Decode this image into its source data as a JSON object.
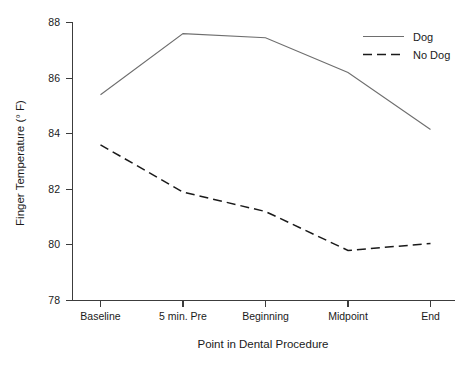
{
  "chart_data": {
    "type": "line",
    "title": "",
    "xlabel": "Point in Dental Procedure",
    "ylabel": "Finger Temperature (° F)",
    "categories": [
      "Baseline",
      "5 min. Pre",
      "Beginning",
      "Midpoint",
      "End"
    ],
    "ylim": [
      78,
      88
    ],
    "yticks": [
      78,
      80,
      82,
      84,
      86,
      88
    ],
    "ytick_labels": [
      "78",
      "80",
      "82",
      "84",
      "86",
      "88"
    ],
    "grid": false,
    "legend_position": "top-right",
    "series": [
      {
        "name": "Dog",
        "style": "solid",
        "color": "#6e6e6e",
        "values": [
          85.4,
          87.6,
          87.45,
          86.2,
          84.15
        ]
      },
      {
        "name": "No Dog",
        "style": "dashed",
        "color": "#1a1a1a",
        "values": [
          83.6,
          81.9,
          81.2,
          79.8,
          80.05
        ]
      }
    ]
  },
  "axes": {
    "y_label": "Finger Temperature (° F)",
    "x_label": "Point in Dental Procedure"
  },
  "legend": {
    "entries": [
      {
        "label": "Dog"
      },
      {
        "label": "No Dog"
      }
    ]
  },
  "ticks": {
    "y": [
      "88",
      "86",
      "84",
      "82",
      "80",
      "78"
    ],
    "x": [
      "Baseline",
      "5 min. Pre",
      "Beginning",
      "Midpoint",
      "End"
    ]
  }
}
